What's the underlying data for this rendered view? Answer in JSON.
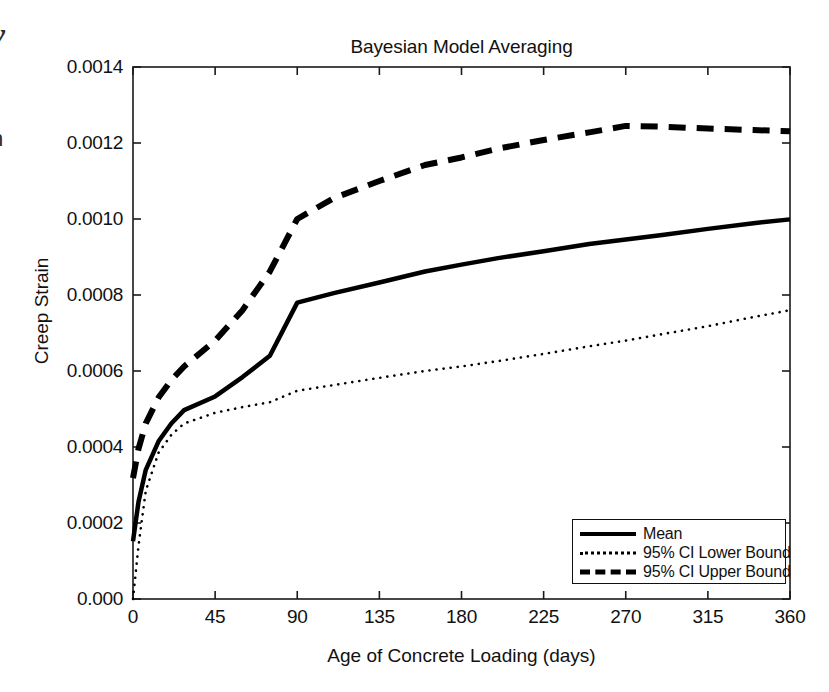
{
  "figure": {
    "edge_fragments": [
      "y",
      "n"
    ]
  },
  "chart_data": {
    "type": "line",
    "title": "Bayesian Model Averaging",
    "xlabel": "Age of Concrete Loading (days)",
    "ylabel": "Creep Strain",
    "xlim": [
      0,
      360
    ],
    "ylim": [
      0,
      0.0014
    ],
    "grid": false,
    "legend_position": "lower right",
    "xticks": [
      0,
      45,
      90,
      135,
      180,
      225,
      270,
      315,
      360
    ],
    "xtick_labels": [
      "0",
      "45",
      "90",
      "135",
      "180",
      "225",
      "270",
      "315",
      "360"
    ],
    "yticks": [
      0,
      0.0002,
      0.0004,
      0.0006,
      0.0008,
      0.001,
      0.0012,
      0.0014
    ],
    "ytick_labels": [
      "0.000",
      "0.0002",
      "0.0004",
      "0.0006",
      "0.0008",
      "0.0010",
      "0.0012",
      "0.0014"
    ],
    "x": [
      0,
      3,
      7,
      14,
      21,
      28,
      45,
      60,
      75,
      90,
      110,
      135,
      160,
      180,
      200,
      225,
      250,
      270,
      290,
      315,
      340,
      360
    ],
    "series": [
      {
        "name": "Mean",
        "style": "solid",
        "color": "#000000",
        "width": 4.5,
        "values": [
          0.000152,
          0.000255,
          0.00034,
          0.000415,
          0.000462,
          0.000497,
          0.000533,
          0.000584,
          0.00064,
          0.00078,
          0.000805,
          0.000833,
          0.000862,
          0.00088,
          0.000897,
          0.000915,
          0.000934,
          0.000946,
          0.000958,
          0.000974,
          0.000989,
          0.000999
        ]
      },
      {
        "name": "95% CI Lower Bound",
        "style": "dotted",
        "color": "#000000",
        "width": 2.6,
        "values": [
          0.0,
          0.00014,
          0.000285,
          0.000385,
          0.000432,
          0.000462,
          0.00049,
          0.000505,
          0.000518,
          0.000548,
          0.000563,
          0.000582,
          0.0006,
          0.000612,
          0.000626,
          0.000645,
          0.000665,
          0.00068,
          0.000697,
          0.000718,
          0.000742,
          0.00076
        ]
      },
      {
        "name": "95% CI Upper Bound",
        "style": "dashed",
        "color": "#000000",
        "width": 6,
        "values": [
          0.000318,
          0.000395,
          0.000462,
          0.00053,
          0.000576,
          0.000612,
          0.00068,
          0.00076,
          0.000862,
          0.001,
          0.001055,
          0.0011,
          0.001142,
          0.001162,
          0.001185,
          0.001208,
          0.001228,
          0.001245,
          0.001243,
          0.001238,
          0.001234,
          0.001231
        ]
      }
    ]
  }
}
